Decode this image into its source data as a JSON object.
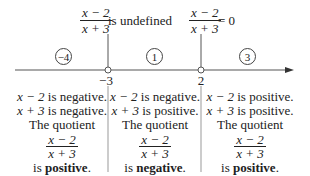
{
  "top_labels": [
    {
      "numerator": "x − 2",
      "denominator": "x + 3",
      "text": "is undefined"
    },
    {
      "numerator": "x − 2",
      "denominator": "x + 3",
      "text": "= 0"
    }
  ],
  "number_line": {
    "critical_points": [
      {
        "value": "−3",
        "marker": "open-circle"
      },
      {
        "value": "2",
        "marker": "open-circle"
      }
    ],
    "test_values": [
      "−4",
      "1",
      "3"
    ],
    "colors": {
      "line": "#444444",
      "text": "#222222"
    }
  },
  "intervals": [
    {
      "test_value": "−4",
      "line1_var": "x − 2",
      "line1_text": " is negative.",
      "line2_var": "x + 3",
      "line2_text": " is negative.",
      "quotient_label": "The quotient",
      "numerator": "x − 2",
      "denominator": "x + 3",
      "result_prefix": "is ",
      "result_sign": "positive",
      "result_suffix": "."
    },
    {
      "test_value": "1",
      "line1_var": "x − 2",
      "line1_text": " is negative.",
      "line2_var": "x + 3",
      "line2_text": " is positive.",
      "quotient_label": "The quotient",
      "numerator": "x − 2",
      "denominator": "x + 3",
      "result_prefix": "is ",
      "result_sign": "negative",
      "result_suffix": "."
    },
    {
      "test_value": "3",
      "line1_var": "x − 2",
      "line1_text": " is positive.",
      "line2_var": "x + 3",
      "line2_text": " is positive.",
      "quotient_label": "The quotient",
      "numerator": "x − 2",
      "denominator": "x + 3",
      "result_prefix": "is ",
      "result_sign": "positive",
      "result_suffix": "."
    }
  ]
}
